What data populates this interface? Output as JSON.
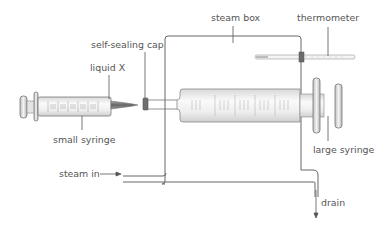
{
  "diagram": {
    "labels": {
      "self_sealing_cap": "self-sealing cap",
      "liquid_x": "liquid X",
      "small_syringe": "small syringe",
      "steam_box": "steam box",
      "thermometer": "thermometer",
      "large_syringe": "large syringe",
      "steam_in": "steam in",
      "drain": "drain"
    },
    "colors": {
      "line": "#555555",
      "label": "#555555",
      "syringe_body": "#f2f2f2",
      "cap": "#777777"
    }
  }
}
